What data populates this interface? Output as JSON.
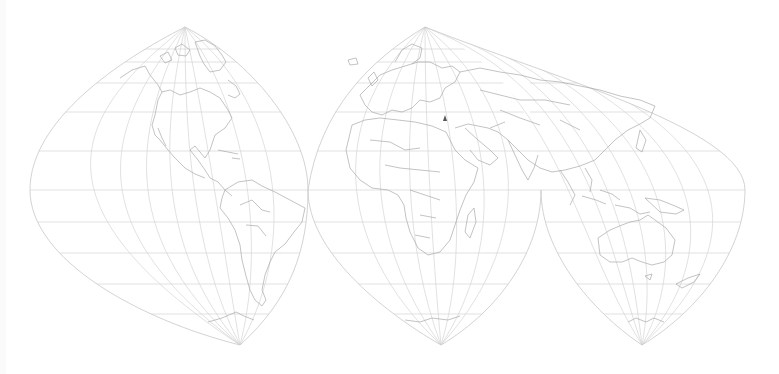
{
  "map": {
    "projection": "interrupted conformal world map (three lobes)",
    "width": 779,
    "height": 374,
    "colors": {
      "background": "#ffffff",
      "graticule": "#d4d4d4",
      "coastline": "#a9a9a9",
      "border": "#b8b8b8",
      "marker": "#555555"
    },
    "equator_y": 190,
    "parallels_y": [
      49,
      62,
      83,
      112,
      151,
      190,
      222,
      253,
      284,
      314
    ],
    "north_poles": [
      {
        "name": "americas-north-pole",
        "x": 185,
        "y": 27
      },
      {
        "name": "eurasia-north-pole",
        "x": 425,
        "y": 27
      }
    ],
    "south_poles": [
      {
        "name": "americas-south-pole",
        "x": 240,
        "y": 345
      },
      {
        "name": "africa-south-pole",
        "x": 441,
        "y": 345
      },
      {
        "name": "australia-south-pole",
        "x": 642,
        "y": 345
      }
    ],
    "lobes": [
      {
        "name": "americas-lobe",
        "outline": "M185,27 C120,60 30,120 30,190 C30,260 140,320 240,345 C290,300 308,250 308,190 C308,130 250,60 185,27 Z"
      },
      {
        "name": "africa-lobe",
        "outline": "M308,190 C308,250 380,310 441,345 C500,310 541,250 541,190"
      },
      {
        "name": "eurasia-australia-lobe",
        "outline": "M308,190 C320,110 370,60 425,27 C560,80 745,130 745,190 C745,250 700,310 642,345 C590,310 541,250 541,190"
      }
    ],
    "marker": {
      "name": "location-marker",
      "x": 445,
      "y": 119
    }
  }
}
